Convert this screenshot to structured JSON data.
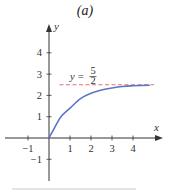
{
  "figure": {
    "title": "(a)"
  },
  "chart_data": {
    "type": "line",
    "title": "(a)",
    "xlabel": "x",
    "ylabel": "y",
    "xlim": [
      -1.5,
      5.4
    ],
    "ylim": [
      -2,
      5.4
    ],
    "x_ticks": [
      -1,
      1,
      2,
      3,
      4
    ],
    "x_tick_labels": [
      "−1",
      "1",
      "2",
      "3",
      "4"
    ],
    "y_ticks": [
      -1,
      1,
      2,
      3,
      4
    ],
    "y_tick_labels": [
      "−1",
      "1",
      "2",
      "3",
      "4"
    ],
    "grid": false,
    "series": [
      {
        "name": "curve",
        "color": "#5b76c4",
        "x": [
          0,
          0.25,
          0.57,
          1,
          1.5,
          2,
          2.5,
          3,
          3.5,
          4,
          4.8
        ],
        "y": [
          0,
          0.45,
          1,
          1.4,
          1.85,
          2.1,
          2.25,
          2.35,
          2.42,
          2.45,
          2.48
        ]
      }
    ],
    "asymptote": {
      "y": 2.5,
      "style": "dashed",
      "color": "#e0707a",
      "x_range": [
        0.5,
        5.0
      ],
      "label_prefix": "y = ",
      "label_num": "5",
      "label_den": "2"
    }
  },
  "colors": {
    "axis": "#333333",
    "curve": "#5b76c4",
    "asymptote": "#e0707a",
    "footer_rule": "#c8c8c8"
  }
}
